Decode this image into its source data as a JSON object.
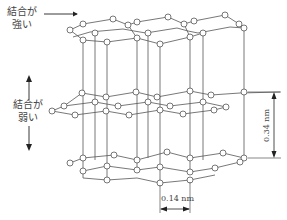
{
  "labels": {
    "strong_bond_line1": "結合が",
    "strong_bond_line2": "強い",
    "weak_bond_line1": "結合が",
    "weak_bond_line2": "弱い",
    "interlayer_distance": "0.34 nm",
    "bond_length": "0.14 nm"
  },
  "diagram": {
    "layers": 3,
    "colors": {
      "line": "#555555",
      "atom_fill": "#ffffff",
      "text": "#444444"
    }
  }
}
